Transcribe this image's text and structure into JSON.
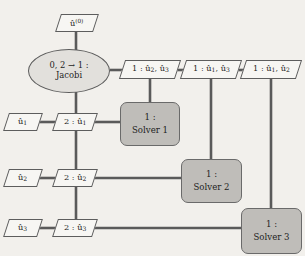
{
  "diagram": {
    "colors": {
      "background": "#f2f0ec",
      "parallelogram_fill": "#f7f6f3",
      "ellipse_fill": "#e2e0dc",
      "solver_fill": "#bfbdb9",
      "stroke": "#5d5d5d",
      "text": "#1d1d1d"
    },
    "nodes": {
      "initial": {
        "label": "û(0)",
        "text_main": "û",
        "text_sup": "(0)",
        "shape": "parallelogram"
      },
      "jacobi": {
        "line1": "0, 2 → 1 :",
        "line2": "Jacobi",
        "shape": "ellipse"
      },
      "top_data": [
        {
          "prefix": "1 :",
          "vars": "û2, û3",
          "shape": "parallelogram"
        },
        {
          "prefix": "1 :",
          "vars": "û1, û3",
          "shape": "parallelogram"
        },
        {
          "prefix": "1 :",
          "vars": "û1, û2",
          "shape": "parallelogram"
        }
      ],
      "left_inputs": [
        {
          "label": "û1",
          "base": "û",
          "sub": "1",
          "shape": "parallelogram"
        },
        {
          "label": "û2",
          "base": "û",
          "sub": "2",
          "shape": "parallelogram"
        },
        {
          "label": "û3",
          "base": "û",
          "sub": "3",
          "shape": "parallelogram"
        }
      ],
      "spine_data": [
        {
          "label": "2 : û1",
          "prefix": "2 :",
          "base": "û",
          "sub": "1",
          "shape": "parallelogram"
        },
        {
          "label": "2 : û2",
          "prefix": "2 :",
          "base": "û",
          "sub": "2",
          "shape": "parallelogram"
        },
        {
          "label": "2 : û3",
          "prefix": "2 :",
          "base": "û",
          "sub": "3",
          "shape": "parallelogram"
        }
      ],
      "solvers": [
        {
          "line1": "1 :",
          "line2": "Solver 1",
          "shape": "rounded-rect"
        },
        {
          "line1": "1 :",
          "line2": "Solver 2",
          "shape": "rounded-rect"
        },
        {
          "line1": "1 :",
          "line2": "Solver 3",
          "shape": "rounded-rect"
        }
      ]
    },
    "edges": [
      {
        "from": "initial",
        "to": "jacobi",
        "orientation": "vertical"
      },
      {
        "from": "jacobi",
        "to": "top-data-1",
        "orientation": "horizontal"
      },
      {
        "from": "top-data-1",
        "to": "top-data-2",
        "orientation": "horizontal"
      },
      {
        "from": "top-data-2",
        "to": "top-data-3",
        "orientation": "horizontal"
      },
      {
        "from": "jacobi",
        "to": "spine-data-1",
        "orientation": "vertical"
      },
      {
        "from": "spine-data-1",
        "to": "spine-data-2",
        "orientation": "vertical"
      },
      {
        "from": "spine-data-2",
        "to": "spine-data-3",
        "orientation": "vertical"
      },
      {
        "from": "left-input-1",
        "to": "spine-data-1",
        "orientation": "horizontal"
      },
      {
        "from": "left-input-2",
        "to": "spine-data-2",
        "orientation": "horizontal"
      },
      {
        "from": "left-input-3",
        "to": "spine-data-3",
        "orientation": "horizontal"
      },
      {
        "from": "spine-data-1",
        "to": "solver-1",
        "orientation": "horizontal"
      },
      {
        "from": "spine-data-2",
        "to": "solver-2",
        "orientation": "horizontal"
      },
      {
        "from": "spine-data-3",
        "to": "solver-3",
        "orientation": "horizontal"
      },
      {
        "from": "top-data-1",
        "to": "solver-1",
        "orientation": "vertical"
      },
      {
        "from": "top-data-2",
        "to": "solver-2",
        "orientation": "vertical"
      },
      {
        "from": "top-data-3",
        "to": "solver-3",
        "orientation": "vertical"
      }
    ]
  }
}
